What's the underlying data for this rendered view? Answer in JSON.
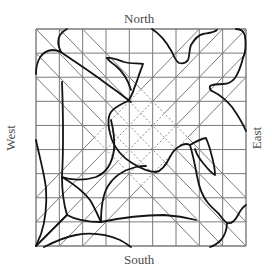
{
  "labels": {
    "north": "North",
    "south": "South",
    "west": "West",
    "east": "East"
  },
  "grid": {
    "columns": 9,
    "rows": 9,
    "frame": {
      "x0": 36,
      "y0": 29,
      "x1": 246,
      "y1": 246
    },
    "line_color": "#7a7a7a",
    "diagonal_bands": {
      "backslash_offsets_i_minus_j": [
        -2,
        -1,
        0,
        1,
        2
      ],
      "slash_sums_i_plus_j": [
        7,
        8,
        9,
        10,
        11
      ],
      "overlap_style": "dotted"
    }
  },
  "colors": {
    "curve": "#141414",
    "grid": "#7a7a7a",
    "dotted": "#8a8a8a",
    "label": "#4a4a4a"
  }
}
